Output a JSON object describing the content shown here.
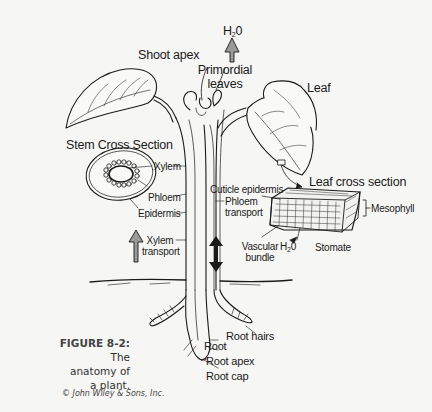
{
  "figure": {
    "number": "FIGURE 8-2:",
    "caption_lines": [
      "The",
      "anatomy of",
      "a plant."
    ],
    "credit": "© John Wiley & Sons, Inc."
  },
  "labels": {
    "shoot_apex": "Shoot apex",
    "primordial_leaves": [
      "Primordial",
      "leaves"
    ],
    "water_top": {
      "base": "H",
      "sub": "2",
      "tail": "0"
    },
    "leaf": "Leaf",
    "stem_cross_section": "Stem Cross Section",
    "xylem": "Xylem",
    "phloem": "Phloem",
    "epidermis": "Epidermis",
    "xylem_transport": [
      "Xylem",
      "transport"
    ],
    "phloem_transport": [
      "Phloem",
      "transport"
    ],
    "leaf_cross_section": "Leaf cross section",
    "cuticle_epidermis": "Cuticle epidermis",
    "mesophyll": "Mesophyll",
    "vascular_bundle": [
      "Vascular",
      "bundle"
    ],
    "water_stomate": {
      "base": "H",
      "sub": "2",
      "tail": "0"
    },
    "stomate": "Stomate",
    "root_hairs": "Root hairs",
    "root": "Root",
    "root_apex": "Root apex",
    "root_cap": "Root cap"
  },
  "icons": {
    "up_arrow_top": "up-arrow",
    "up_arrow_xylem": "up-arrow",
    "double_arrow_phloem": "up-down-arrow",
    "stomate_arrow": "left-arrow"
  },
  "colors": {
    "background": "#f6f6f4",
    "ink": "#1a1a1a",
    "arrow_fill": "#9a9a9a"
  }
}
